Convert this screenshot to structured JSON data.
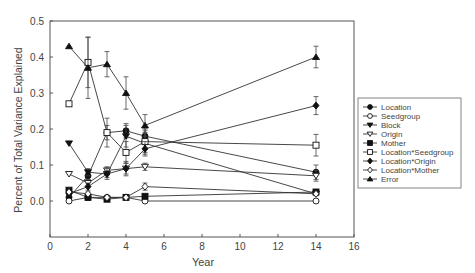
{
  "chart_data": {
    "type": "line",
    "title": "",
    "xlabel": "Year",
    "ylabel": "Percent of Total Variance Explained",
    "xlim": [
      0,
      16
    ],
    "ylim": [
      -0.1,
      0.5
    ],
    "xticks": [
      0,
      2,
      4,
      6,
      8,
      10,
      12,
      14,
      16
    ],
    "yticks": [
      0.0,
      0.1,
      0.2,
      0.3,
      0.4,
      0.5
    ],
    "ytick_labels": [
      "0.0",
      "0.1",
      "0.2",
      "0.3",
      "0.4",
      "0.5"
    ],
    "grid": false,
    "legend_position": "right",
    "x": [
      1,
      2,
      3,
      4,
      5,
      14
    ],
    "series": [
      {
        "name": "Location",
        "marker": "circle-filled",
        "values": [
          0.01,
          0.07,
          0.19,
          0.195,
          0.18,
          0.08
        ],
        "err": [
          0.005,
          0.01,
          0.02,
          0.02,
          0.02,
          0.02
        ]
      },
      {
        "name": "Seedgroup",
        "marker": "circle-open",
        "values": [
          0.0,
          0.01,
          0.01,
          0.01,
          0.0,
          0.0
        ],
        "err": [
          0,
          0,
          0,
          0,
          0,
          0
        ]
      },
      {
        "name": "Block",
        "marker": "triangle-down-filled",
        "values": [
          0.16,
          0.08,
          0.075,
          0.18,
          0.16,
          0.02
        ],
        "err": [
          0,
          0.01,
          0.01,
          0.03,
          0.03,
          0.005
        ]
      },
      {
        "name": "Origin",
        "marker": "triangle-down-open",
        "values": [
          0.075,
          0.05,
          0.085,
          0.09,
          0.095,
          0.07
        ],
        "err": [
          0,
          0.01,
          0.01,
          0.015,
          0.01,
          0.015
        ]
      },
      {
        "name": "Mother",
        "marker": "square-filled",
        "values": [
          0.03,
          0.01,
          0.005,
          0.01,
          0.013,
          0.025
        ],
        "err": [
          0,
          0,
          0,
          0,
          0,
          0.005
        ]
      },
      {
        "name": "Location*Seedgroup",
        "marker": "square-open",
        "values": [
          0.27,
          0.385,
          0.19,
          0.135,
          0.165,
          0.155
        ],
        "err": [
          0,
          0.07,
          0.04,
          0.03,
          0.03,
          0.03
        ]
      },
      {
        "name": "Location*Origin",
        "marker": "diamond-filled",
        "values": [
          0.02,
          0.04,
          0.075,
          0.09,
          0.145,
          0.265
        ],
        "err": [
          0,
          0.01,
          0.015,
          0.02,
          0.02,
          0.025
        ]
      },
      {
        "name": "Location*Mother",
        "marker": "diamond-open",
        "values": [
          0.025,
          0.02,
          0.01,
          0.01,
          0.04,
          0.02
        ],
        "err": [
          0,
          0.005,
          0,
          0,
          0.01,
          0.005
        ]
      },
      {
        "name": "Error",
        "marker": "triangle-up-filled",
        "values": [
          0.43,
          0.37,
          0.38,
          0.3,
          0.21,
          0.4
        ],
        "err": [
          0,
          0.085,
          0.035,
          0.045,
          0.03,
          0.03
        ]
      }
    ]
  },
  "legend": {
    "items": [
      "Location",
      "Seedgroup",
      "Block",
      "Origin",
      "Mother",
      "Location*Seedgroup",
      "Location*Origin",
      "Location*Mother",
      "Error"
    ]
  }
}
